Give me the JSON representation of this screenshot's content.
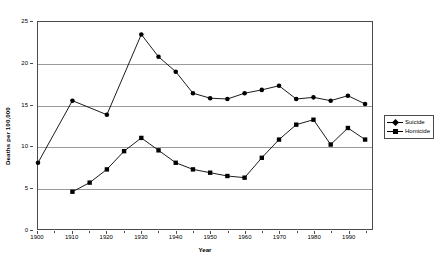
{
  "chart_data": {
    "type": "line",
    "title": "",
    "xlabel": "Year",
    "ylabel": "Deaths per 100,000",
    "xlim": [
      1900,
      1997
    ],
    "ylim": [
      0,
      25
    ],
    "yticks": [
      0,
      5,
      10,
      15,
      20,
      25
    ],
    "xticks": [
      1900,
      1910,
      1920,
      1930,
      1940,
      1950,
      1960,
      1970,
      1980,
      1990
    ],
    "xminorticks": [
      1905,
      1915,
      1925,
      1935,
      1945,
      1955,
      1965,
      1975,
      1985,
      1995
    ],
    "grid": true,
    "legend_position": "right",
    "series": [
      {
        "name": "Suicide",
        "marker": "diamond",
        "x": [
          1900,
          1910,
          1920,
          1930,
          1935,
          1940,
          1945,
          1950,
          1955,
          1960,
          1965,
          1970,
          1975,
          1980,
          1985,
          1990,
          1995
        ],
        "values": [
          8.0,
          15.5,
          13.8,
          23.5,
          20.8,
          19.0,
          16.4,
          15.8,
          15.7,
          16.4,
          16.8,
          17.3,
          15.7,
          15.9,
          15.5,
          16.1,
          15.1
        ]
      },
      {
        "name": "Homicide",
        "marker": "square",
        "x": [
          1910,
          1915,
          1920,
          1925,
          1930,
          1935,
          1940,
          1945,
          1950,
          1955,
          1960,
          1965,
          1970,
          1975,
          1980,
          1985,
          1990,
          1995
        ],
        "values": [
          4.5,
          5.6,
          7.2,
          9.4,
          11.0,
          9.5,
          8.0,
          7.2,
          6.8,
          6.4,
          6.2,
          8.6,
          10.8,
          12.6,
          13.2,
          10.2,
          12.2,
          10.8
        ]
      }
    ]
  },
  "legend": {
    "items": [
      {
        "label": "Suicide"
      },
      {
        "label": "Homicide"
      }
    ]
  },
  "colors": {
    "series": "#000000",
    "grid": "#9a9a9a",
    "axis": "#4a4a4a",
    "background": "#ffffff"
  }
}
